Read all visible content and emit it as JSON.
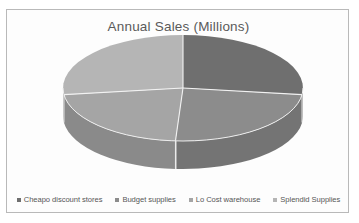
{
  "document": {
    "scan_artifact_text": ""
  },
  "chart": {
    "title": "Annual Sales (Millions)",
    "legend": {
      "position": "bottom",
      "items": [
        {
          "label": "Cheapo discount stores",
          "color": "#6f6f6f"
        },
        {
          "label": "Budget supplies",
          "color": "#8c8c8c"
        },
        {
          "label": "Lo Cost warehouse",
          "color": "#a5a5a5"
        },
        {
          "label": "Splendid Supplies",
          "color": "#b5b5b5"
        }
      ]
    }
  },
  "chart_data": {
    "type": "pie",
    "title": "Annual Sales (Millions)",
    "subtitle": "",
    "xlabel": "",
    "ylabel": "",
    "three_d": true,
    "labels": [
      "Cheapo discount stores",
      "Budget supplies",
      "Lo Cost warehouse",
      "Splendid Supplies"
    ],
    "values": [
      27,
      24,
      22,
      27
    ],
    "percentages": [
      27,
      24,
      22,
      27
    ],
    "colors": [
      "#6f6f6f",
      "#8c8c8c",
      "#a5a5a5",
      "#b5b5b5"
    ],
    "side_colors": [
      "#5a5a5a",
      "#747474",
      "#8a8a8a",
      "#969696"
    ],
    "start_angle_deg": 0,
    "legend_position": "bottom",
    "grid": false,
    "data_labels_shown": false
  },
  "geometry": {
    "center_x": 176,
    "center_y": 56,
    "radius_x": 120,
    "radius_y": 53,
    "depth": 28
  }
}
